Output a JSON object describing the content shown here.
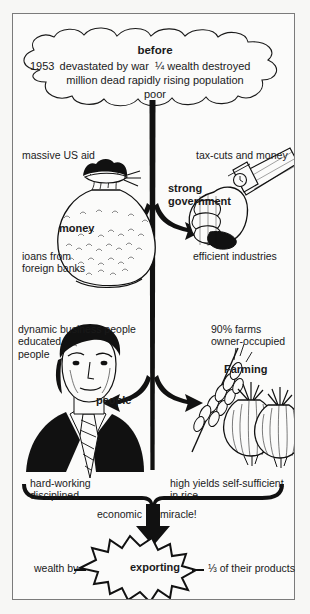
{
  "diagram": {
    "title": "before",
    "cloud": {
      "heading": "before",
      "year": "1953",
      "line1": "devastated by war  ¼ wealth destroyed",
      "line2": "million dead rapidly rising population",
      "line3": "poor"
    },
    "branches": [
      {
        "id": "money",
        "top_label": "massive US aid",
        "icon": "money-bag-icon",
        "icon_label": "money",
        "bottom_label": "ioans from\nforeign banks"
      },
      {
        "id": "government",
        "top_label": "tax-cuts and money",
        "icon": "fist-arm-icon",
        "icon_label": "strong\ngovernment",
        "bottom_label": "efficient industries"
      },
      {
        "id": "people",
        "top_label": "dynamic business people\neducated\npeople",
        "icon": "businessman-portrait-icon",
        "icon_label": "people",
        "bottom_label": "hard-working\ndisciplined"
      },
      {
        "id": "farming",
        "top_label": "90% farms\nowner-occupied",
        "icon": "wheat-and-onions-icon",
        "icon_label": "Farming",
        "bottom_label": "high yields self-sufficient\nin rice"
      }
    ],
    "outcome": {
      "arrow_label_left": "economic",
      "arrow_label_right": "miracle!",
      "prefix": "wealth by",
      "burst_label": "exporting",
      "suffix": "⅓ of their products"
    },
    "colors": {
      "ink": "#111111",
      "paper": "#fbfbfa",
      "frame": "#7b7b7b",
      "page_bg": "#f7f7f5"
    }
  }
}
